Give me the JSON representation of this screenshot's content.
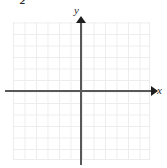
{
  "figure": {
    "label": "2",
    "type": "cartesian-coordinate-grid",
    "background_color": "#ffffff"
  },
  "grid": {
    "line_color": "#ededed",
    "columns": 12,
    "rows": 12,
    "cell_size_px": 11.5
  },
  "axes": {
    "color": "#585858",
    "arrow_color": "#1f1f1f",
    "x": {
      "label": "x",
      "label_style": "italic",
      "arrow": "right"
    },
    "y": {
      "label": "y",
      "label_style": "italic",
      "arrow": "up"
    },
    "origin_marked": false,
    "tick_labels": []
  },
  "chart_data": {
    "type": "scatter",
    "title": "",
    "xlabel": "x",
    "ylabel": "y",
    "x": [],
    "y": [],
    "series": [],
    "xlim": [
      -6,
      6
    ],
    "ylim": [
      -6,
      6
    ],
    "grid": true,
    "legend": "none",
    "annotations": []
  }
}
